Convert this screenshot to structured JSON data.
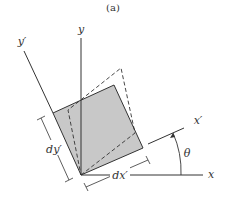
{
  "caption": "(a)",
  "labels": {
    "y": "y",
    "y_prime": "y′",
    "x": "x",
    "x_prime": "x′",
    "theta": "θ",
    "dx_prime": "dx′",
    "dy_prime": "dy′"
  },
  "colors": {
    "fill": "#c8c8c8",
    "stroke": "#333333"
  }
}
